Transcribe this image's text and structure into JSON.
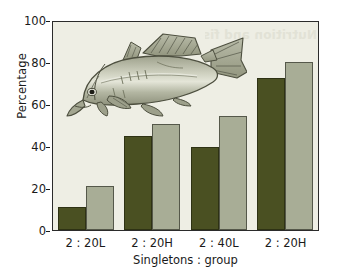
{
  "chart_data": {
    "type": "bar",
    "title": "",
    "subtitle": "",
    "xlabel": "Singletons : group",
    "ylabel": "Percentage",
    "categories": [
      "2 : 20L",
      "2 : 20H",
      "2 : 40L",
      "2 : 20H"
    ],
    "series": [
      {
        "name": "dark-olive-series",
        "color": "#4a5022",
        "values": [
          11,
          45,
          40,
          73
        ]
      },
      {
        "name": "sage-gray-series",
        "color": "#a8ad96",
        "values": [
          21,
          51,
          55,
          81
        ]
      }
    ],
    "ylim": [
      0,
      100
    ],
    "yticks": [
      0,
      20,
      40,
      60,
      80,
      100
    ],
    "ytick_labels": [
      "0",
      "20",
      "40",
      "60",
      "80",
      "100"
    ],
    "grid": false,
    "legend": "none",
    "legend_position": "none",
    "annotations": [
      {
        "name": "fish-illustration",
        "description": "Line drawing of a cod-like fish facing left, inside the upper-left of the plot area"
      }
    ],
    "colors": {
      "plot_background": "#eeeee4",
      "figure_background": "#ffffff",
      "axis": "#2b2b2b",
      "text": "#1a1a1a",
      "series_dark": "#4a5022",
      "series_light": "#a8ad96"
    }
  },
  "artifacts": {
    "show_through_text": "Nutrition and fish"
  }
}
